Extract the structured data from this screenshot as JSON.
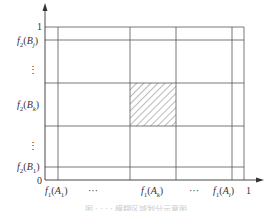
{
  "figure": {
    "y_axis": {
      "top_label": "1",
      "origin_label": "0",
      "tick_labels": [
        {
          "fn": "f",
          "sub": "2",
          "arg": "B",
          "argsub": "j",
          "y": 40
        },
        {
          "fn": "⋮",
          "y": 62
        },
        {
          "fn": "f",
          "sub": "2",
          "arg": "B",
          "argsub": "k",
          "y": 104
        },
        {
          "fn": "⋮",
          "y": 146
        },
        {
          "fn": "f",
          "sub": "2",
          "arg": "B",
          "argsub": "1",
          "y": 166
        }
      ]
    },
    "x_axis": {
      "right_label": "1",
      "tick_labels": [
        {
          "text": "f1(A1)",
          "x": 58
        },
        {
          "text": "···",
          "x": 92
        },
        {
          "text": "f1(Ak)",
          "x": 152
        },
        {
          "text": "···",
          "x": 204
        },
        {
          "text": "f1(Ai)",
          "x": 238
        }
      ]
    },
    "labels": {
      "y_top": "1",
      "origin": "0",
      "x_right": "1",
      "f2_Bj": "f2(Bj)",
      "f2_Bk": "f2(Bk)",
      "f2_B1": "f2(B1)",
      "vdots": "⋮",
      "f1_A1": "f1(A1)",
      "f1_Ak": "f1(Ak)",
      "f1_Ai": "f1(Ai)",
      "hdots": "···"
    },
    "grid": {
      "vertical_x": [
        58,
        130,
        176,
        232,
        244
      ],
      "horizontal_y": [
        27,
        40,
        83,
        126,
        167
      ],
      "hatched_cell": {
        "x0": 130,
        "x1": 176,
        "y0": 83,
        "y1": 126
      }
    },
    "colors": {
      "line": "#555555",
      "hatch": "#666666",
      "background": "#ffffff"
    },
    "caption": "图 · · · · 模糊区域划分示意图"
  }
}
